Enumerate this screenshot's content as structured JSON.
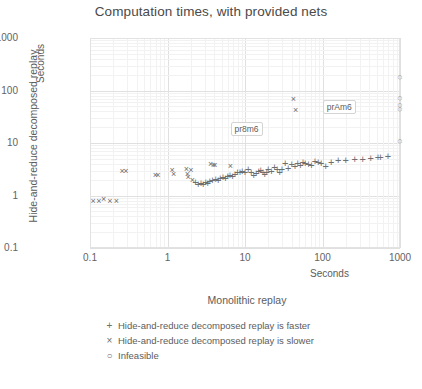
{
  "chart_data": {
    "type": "scatter",
    "title": "Computation times, with provided nets",
    "xlabel": "Monolithic replay",
    "ylabel": "Hide-and-reduce decomposed replay",
    "x_units_label": "Seconds",
    "y_units_label": "Seconds",
    "xscale": "log",
    "yscale": "log",
    "xlim": [
      0.1,
      1000
    ],
    "ylim": [
      0.1,
      1000
    ],
    "xticks": [
      "0.1",
      "1",
      "10",
      "100",
      "1000"
    ],
    "yticks": [
      "1000",
      "100",
      "10",
      "1",
      "0.1"
    ],
    "grid": "major decades plus faint log minor lines",
    "legend_position": "below plot, centered",
    "legend": [
      {
        "marker": "+",
        "label": "Hide-and-reduce decomposed replay is faster"
      },
      {
        "marker": "×",
        "label": "Hide-and-reduce decomposed replay is slower"
      },
      {
        "marker": "○",
        "label": "Infeasible"
      }
    ],
    "annotations": [
      {
        "text": "pr8m6",
        "x": 24,
        "y": 33
      },
      {
        "text": "prAm6",
        "x": 75,
        "y": 55
      }
    ],
    "series": [
      {
        "name": "Hide-and-reduce decomposed replay is slower",
        "marker": "×",
        "points": [
          [
            0.11,
            0.8
          ],
          [
            0.13,
            0.78
          ],
          [
            0.15,
            0.86
          ],
          [
            0.18,
            0.8
          ],
          [
            0.22,
            0.78
          ],
          [
            0.26,
            2.9
          ],
          [
            0.29,
            2.9
          ],
          [
            0.7,
            2.5
          ],
          [
            0.75,
            2.5
          ],
          [
            1.15,
            3.1
          ],
          [
            1.2,
            2.6
          ],
          [
            1.75,
            3.2
          ],
          [
            1.8,
            2.6
          ],
          [
            1.85,
            2.3
          ],
          [
            2.0,
            3.1
          ],
          [
            2.1,
            2.0
          ],
          [
            3.6,
            4.0
          ],
          [
            3.9,
            3.9
          ],
          [
            4.1,
            3.9
          ],
          [
            6.5,
            3.6
          ],
          [
            42,
            70
          ],
          [
            45,
            43
          ]
        ]
      },
      {
        "name": "Hide-and-reduce decomposed replay is faster",
        "marker": "+",
        "points": [
          [
            2.3,
            1.9
          ],
          [
            2.5,
            1.75
          ],
          [
            2.7,
            1.8
          ],
          [
            2.9,
            1.7
          ],
          [
            3.1,
            1.9
          ],
          [
            3.3,
            1.8
          ],
          [
            3.5,
            2.0
          ],
          [
            3.8,
            2.1
          ],
          [
            4.2,
            2.2
          ],
          [
            4.5,
            2.1
          ],
          [
            4.8,
            2.3
          ],
          [
            5.2,
            2.4
          ],
          [
            5.6,
            2.3
          ],
          [
            6.0,
            2.5
          ],
          [
            6.4,
            2.6
          ],
          [
            6.9,
            2.5
          ],
          [
            7.4,
            2.7
          ],
          [
            8.0,
            2.9
          ],
          [
            8.6,
            3.0
          ],
          [
            9.2,
            3.1
          ],
          [
            10,
            2.9
          ],
          [
            11,
            3.4
          ],
          [
            12,
            3.0
          ],
          [
            13,
            2.6
          ],
          [
            14,
            2.8
          ],
          [
            15,
            3.1
          ],
          [
            16,
            3.2
          ],
          [
            17,
            2.9
          ],
          [
            18,
            2.7
          ],
          [
            19,
            3.0
          ],
          [
            20,
            3.3
          ],
          [
            22,
            3.1
          ],
          [
            24,
            3.6
          ],
          [
            26,
            3.3
          ],
          [
            28,
            3.0
          ],
          [
            30,
            3.4
          ],
          [
            33,
            4.3
          ],
          [
            36,
            3.5
          ],
          [
            40,
            4.2
          ],
          [
            44,
            3.9
          ],
          [
            48,
            4.4
          ],
          [
            52,
            4.0
          ],
          [
            56,
            4.6
          ],
          [
            60,
            4.3
          ],
          [
            66,
            4.1
          ],
          [
            72,
            4.0
          ],
          [
            80,
            4.8
          ],
          [
            88,
            4.6
          ],
          [
            96,
            4.4
          ],
          [
            110,
            3.8
          ],
          [
            130,
            4.6
          ],
          [
            160,
            4.9
          ],
          [
            200,
            5.0
          ],
          [
            260,
            5.2
          ],
          [
            330,
            5.3
          ],
          [
            420,
            5.4
          ],
          [
            520,
            5.6
          ],
          [
            560,
            5.6
          ],
          [
            700,
            5.8
          ]
        ]
      },
      {
        "name": "Infeasible",
        "marker": "○",
        "points": [
          [
            1000,
            185
          ],
          [
            1000,
            72
          ],
          [
            1000,
            52
          ],
          [
            1000,
            44
          ],
          [
            1000,
            11
          ]
        ]
      }
    ]
  }
}
